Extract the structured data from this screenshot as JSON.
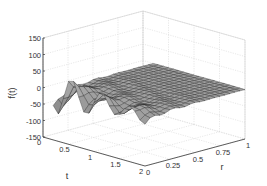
{
  "chart_data": {
    "type": "surface3d",
    "title": "",
    "xlabel": "r",
    "ylabel": "t",
    "zlabel": "f(t)",
    "x_ticks": [
      "0",
      "0.25",
      "0.5",
      "0.75",
      "1"
    ],
    "y_ticks": [
      "0",
      "0.5",
      "1",
      "1.5",
      "2"
    ],
    "z_ticks": [
      "-150",
      "-100",
      "-50",
      "0",
      "50",
      "100",
      "150"
    ],
    "xlim": [
      0,
      1
    ],
    "ylim": [
      0,
      2
    ],
    "zlim": [
      -150,
      150
    ],
    "grid": true,
    "colormap": "gray",
    "r": [
      0,
      0.05,
      0.1,
      0.15,
      0.2,
      0.25,
      0.3,
      0.35,
      0.4,
      0.45,
      0.5,
      0.55,
      0.6,
      0.65,
      0.7,
      0.75,
      0.8,
      0.85,
      0.9,
      0.95,
      1.0
    ],
    "t": [
      0.2,
      0.3,
      0.4,
      0.5,
      0.6,
      0.7,
      0.8,
      0.9,
      1.0,
      1.1,
      1.2,
      1.3,
      1.4,
      1.5,
      1.6,
      1.7,
      1.8,
      1.9,
      2.0
    ]
  },
  "axes": {
    "z_label": "f(t)",
    "t_label": "t",
    "r_label": "r"
  }
}
